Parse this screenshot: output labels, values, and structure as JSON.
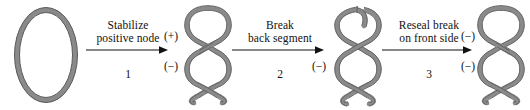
{
  "figure": {
    "background_color": "#ffffff",
    "strand_color": "#8a8a8a",
    "strand_outline_color": "#5e5e5e",
    "text_color": "#111111",
    "arrow_color": "#111111"
  },
  "stages": [
    {
      "id": "relaxed-circle",
      "name": "relaxed-dna-circle",
      "shape": "ellipse",
      "crossings": 0
    },
    {
      "id": "supercoil-positive",
      "name": "supercoiled-dna-positive-node",
      "shape": "plectoneme",
      "lobes": 3,
      "crossings": 2,
      "broken": false
    },
    {
      "id": "supercoil-broken",
      "name": "supercoiled-dna-broken-back-segment",
      "shape": "plectoneme",
      "lobes": 3,
      "crossings": 2,
      "broken": true
    },
    {
      "id": "supercoil-resealed",
      "name": "supercoiled-dna-resealed",
      "shape": "plectoneme",
      "lobes": 3,
      "crossings": 2,
      "broken": false
    }
  ],
  "steps": [
    {
      "label": "Stabilize\npositive node",
      "line1": "Stabilize",
      "line2": "positive node",
      "number": "1"
    },
    {
      "label": "Break\nback segment",
      "line1": "Break",
      "line2": "back segment",
      "number": "2"
    },
    {
      "label": "Reseal break\non front side",
      "line1": "Reseal break",
      "line2": "on front side",
      "number": "3"
    }
  ],
  "node_signs": {
    "stage2_top": "(+)",
    "stage2_bottom": "(−)",
    "stage3_bottom": "(−)",
    "stage4_top": "(−)",
    "stage4_bottom": "(−)"
  }
}
